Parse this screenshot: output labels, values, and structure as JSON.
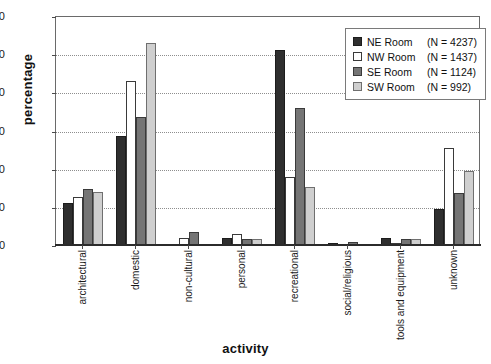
{
  "chart_data": {
    "type": "bar",
    "title": "",
    "xlabel": "activity",
    "ylabel": "percentage",
    "ylim": [
      0,
      60
    ],
    "yticks": [
      0,
      10,
      20,
      30,
      40,
      50,
      60
    ],
    "grid": "horizontal-dotted",
    "legend_position": "top-right",
    "categories": [
      "architectural",
      "domestic",
      "non-cultural",
      "personal",
      "recreational",
      "social/religious",
      "tools and equipment",
      "unknown"
    ],
    "series": [
      {
        "name": "NE Room",
        "legend_label": "NE Room  (N = 4237)",
        "n": 4237,
        "color": "#2f2f2f",
        "values": [
          11.0,
          28.5,
          0.0,
          1.8,
          51.0,
          0.5,
          1.8,
          9.5
        ]
      },
      {
        "name": "NW Room",
        "legend_label": "NW Room (N = 1437)",
        "n": 1437,
        "color": "#ffffff",
        "values": [
          12.5,
          43.0,
          1.8,
          2.8,
          17.8,
          0.0,
          0.3,
          25.3
        ]
      },
      {
        "name": "SE Room",
        "legend_label": "SE Room  (N = 1124)",
        "n": 1124,
        "color": "#757575",
        "values": [
          14.8,
          33.5,
          3.5,
          1.5,
          35.8,
          0.8,
          1.5,
          13.5
        ]
      },
      {
        "name": "SW Room",
        "legend_label": "SW Room (N = 992)",
        "n": 992,
        "color": "#cfcfcf",
        "values": [
          14.0,
          53.0,
          0.0,
          1.5,
          15.3,
          0.0,
          1.5,
          19.5
        ]
      }
    ]
  },
  "legend": {
    "rows": [
      {
        "label": "NE Room",
        "count": "(N = 4237)"
      },
      {
        "label": "NW Room",
        "count": "(N = 1437)"
      },
      {
        "label": "SE Room",
        "count": "(N = 1124)"
      },
      {
        "label": "SW Room",
        "count": "(N = 992)"
      }
    ]
  }
}
